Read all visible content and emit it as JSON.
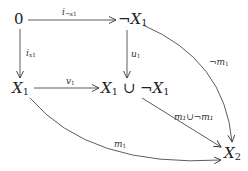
{
  "diagram": {
    "type": "commutative-diagram",
    "nodes": {
      "zero": {
        "label": "0"
      },
      "not_x1": {
        "label": "¬X",
        "sub": "1"
      },
      "x1": {
        "label": "X",
        "sub": "1"
      },
      "union": {
        "label": "X",
        "sub": "1",
        "rest": " ∪ ¬X",
        "sub2": "1"
      },
      "x2": {
        "label": "X",
        "sub": "2"
      }
    },
    "arrows": {
      "i_not_x1": {
        "from": "0",
        "to": "¬X1",
        "label": "i",
        "label_sub": "¬x1"
      },
      "i_x1": {
        "from": "0",
        "to": "X1",
        "label": "i",
        "label_sub": "x1"
      },
      "u1": {
        "from": "¬X1",
        "to": "X1 ∪ ¬X1",
        "label": "u",
        "label_sub": "1"
      },
      "v1": {
        "from": "X1",
        "to": "X1 ∪ ¬X1",
        "label": "v",
        "label_sub": "1"
      },
      "not_m1": {
        "from": "¬X1",
        "to": "X2",
        "label": "¬m",
        "label_sub": "1"
      },
      "m1_union": {
        "from": "X1 ∪ ¬X1",
        "to": "X2",
        "label": "m₁∪¬m₁"
      },
      "m1": {
        "from": "X1",
        "to": "X2",
        "label": "m",
        "label_sub": "1"
      }
    }
  }
}
